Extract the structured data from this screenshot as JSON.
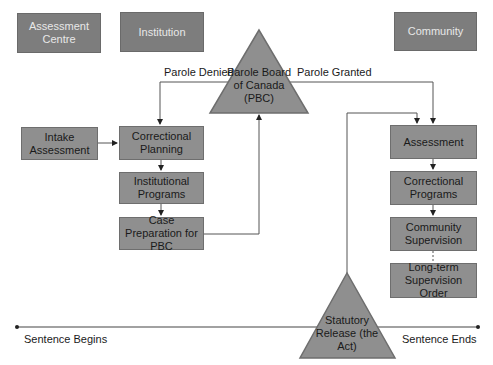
{
  "phases": {
    "assessment_centre": "Assessment Centre",
    "institution": "Institution",
    "community": "Community"
  },
  "nodes": {
    "pbc": "Parole Board of Canada (PBC)",
    "intake_assessment": "Intake Assessment",
    "correctional_planning": "Correctional Planning",
    "institutional_programs": "Institutional Programs",
    "case_preparation": "Case Preparation for PBC",
    "assessment": "Assessment",
    "correctional_programs": "Correctional Programs",
    "community_supervision": "Community Supervision",
    "ltso": "Long-term Supervision Order",
    "statutory_release": "Statutory Release (the Act)"
  },
  "edge_labels": {
    "parole_denied": "Parole Denied",
    "parole_granted": "Parole Granted"
  },
  "timeline": {
    "start": "Sentence Begins",
    "end": "Sentence Ends"
  },
  "colors": {
    "box_fill": "#8f8f8f",
    "phase_fill": "#7d7d7d",
    "line": "#555555"
  }
}
